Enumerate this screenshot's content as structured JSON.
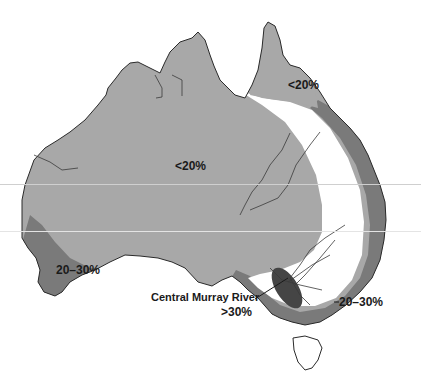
{
  "map": {
    "subject": "Australia",
    "colors": {
      "background": "#ffffff",
      "zone_lt20": "#a8a8a8",
      "zone_20_30": "#7a7a7a",
      "zone_gt30": "#454545",
      "zone_white": "#ffffff",
      "outline": "#2a2a2a",
      "rivers": "#3a3a3a"
    },
    "labels": {
      "central": "<20%",
      "cape_york": "<20%",
      "southwest": "20–30%",
      "southeast": "20–30%",
      "murray_name": "Central Murray River",
      "murray_value": ">30%"
    }
  }
}
